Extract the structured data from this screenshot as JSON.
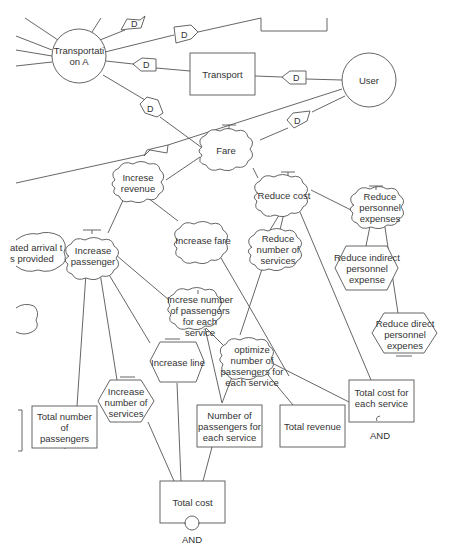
{
  "diagram": {
    "nodes": {
      "transportation_a": {
        "label": "Transportati\non A",
        "shape": "circle"
      },
      "user": {
        "label": "User",
        "shape": "circle"
      },
      "transport": {
        "label": "Transport",
        "shape": "rectangle"
      },
      "fare": {
        "label": "Fare",
        "shape": "cloud"
      },
      "increse_revenue": {
        "label": "Increse\nrevenue",
        "shape": "cloud"
      },
      "reduce_cost": {
        "label": "Reduce cost",
        "shape": "cloud"
      },
      "reduce_personnel_expenses": {
        "label": "Reduce\npersonnel\nexpenses",
        "shape": "cloud"
      },
      "increase_fare": {
        "label": "Increase fare",
        "shape": "cloud"
      },
      "reduce_number_of_services": {
        "label": "Reduce\nnumber of\nservices",
        "shape": "cloud"
      },
      "increase_passenger": {
        "label": "Increase\npassenger",
        "shape": "cloud"
      },
      "estimated_arrival": {
        "label": "ated arrival t\ns provided",
        "shape": "cloud"
      },
      "partial_left_cloud": {
        "label": "e the\nhen\nr",
        "shape": "cloud"
      },
      "increse_number_of_passengers": {
        "label": "Increse number\nof passengers\nfor each\nservice",
        "shape": "cloud"
      },
      "optimize_number": {
        "label": "optimize\nnumber of\npassengers for\neach service",
        "shape": "cloud"
      },
      "reduce_indirect": {
        "label": "Reduce indirect\npersonnel expense",
        "shape": "hexagon"
      },
      "reduce_direct": {
        "label": "Reduce direct\npersonnel\nexpenes",
        "shape": "hexagon"
      },
      "increase_line": {
        "label": "Increase line",
        "shape": "hexagon"
      },
      "increase_number_of_services": {
        "label": "Increase\nnumber of\nservices",
        "shape": "hexagon"
      },
      "total_number_of_passengers": {
        "label": "Total number of\npassengers",
        "shape": "rectangle"
      },
      "number_of_passengers_each": {
        "label": "Number of\npassengers for\neach service",
        "shape": "rectangle"
      },
      "total_revenue": {
        "label": "Total revenue",
        "shape": "rectangle"
      },
      "total_cost_each_service": {
        "label": "Total cost for\neach service",
        "shape": "rectangle"
      },
      "total_cost": {
        "label": "Total cost",
        "shape": "rectangle"
      }
    },
    "dependency_marker": "D",
    "and_labels": {
      "total_cost_each_service": "AND",
      "total_cost": "AND"
    }
  }
}
